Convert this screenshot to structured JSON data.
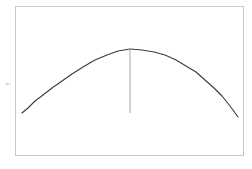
{
  "figure": {
    "background_color": "#ffffff",
    "frame": {
      "color": "#c8c8c8",
      "left": 15.5,
      "top": 6.5,
      "right": 243.5,
      "bottom": 155.5,
      "line_width": 1
    },
    "y_axis_label": "y"
  },
  "chart_data": {
    "type": "line",
    "title": "",
    "subtitle": "",
    "xlabel": "",
    "ylabel": "y",
    "grid": false,
    "legend": null,
    "axis_ticks": {
      "x": [],
      "y": []
    },
    "xlim": [
      15.5,
      243.5
    ],
    "ylim": [
      155.5,
      6.5
    ],
    "series": [
      {
        "name": "arch-curve",
        "color": "#3b3b3b",
        "line_width": 1.1,
        "x": [
          22,
          28,
          35,
          43,
          52,
          62,
          72,
          83,
          95,
          107,
          118,
          130,
          142,
          154,
          165,
          176,
          186,
          196,
          205,
          214,
          222,
          230,
          238
        ],
        "y": [
          113,
          108,
          101,
          95,
          88,
          81,
          74,
          67,
          60,
          55,
          51,
          49,
          50,
          52,
          55,
          60,
          66,
          72,
          80,
          88,
          96,
          106,
          117
        ]
      }
    ],
    "annotations": [
      {
        "name": "apex-drop-line",
        "type": "vline",
        "color": "#b4b4b4",
        "line_width": 1.2,
        "x": 130,
        "y_start": 49,
        "y_end": 113
      }
    ]
  }
}
